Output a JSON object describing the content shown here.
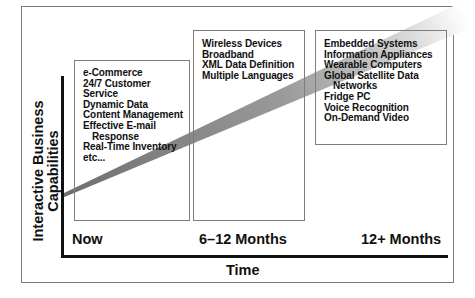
{
  "diagram": {
    "y_axis_label": [
      "Interactive Business",
      "Capabilities"
    ],
    "x_axis_label": "Time",
    "time_ticks": [
      "Now",
      "6–12 Months",
      "12+ Months"
    ],
    "stages": [
      {
        "period": "Now",
        "items": [
          "e-Commerce",
          "24/7 Customer",
          "Service",
          "Dynamic Data",
          "Content Management",
          "Effective E-mail",
          "Response",
          "Real-Time Inventory",
          "etc..."
        ]
      },
      {
        "period": "6–12 Months",
        "items": [
          "Wireless Devices",
          "Broadband",
          "XML Data Definition",
          "Multiple Languages"
        ]
      },
      {
        "period": "12+ Months",
        "items": [
          "Embedded Systems",
          "Information Appliances",
          "Wearable Computers",
          "Global Satellite Data",
          "Networks",
          "Fridge PC",
          "Voice Recognition",
          "On-Demand Video"
        ]
      }
    ],
    "wedge": {
      "description": "growth-wedge",
      "start_color": "#7a7a7a",
      "end_color": "#ffffff"
    }
  }
}
